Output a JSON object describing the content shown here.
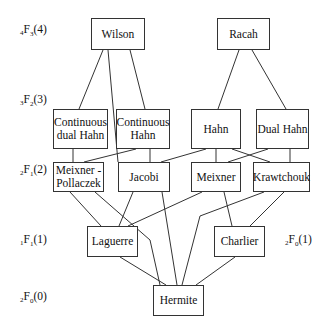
{
  "diagram": {
    "levels": [
      {
        "id": "l4",
        "pre": "4",
        "F": "F",
        "sub": "3",
        "arg": "(4)",
        "x": 20,
        "y": 31
      },
      {
        "id": "l3",
        "pre": "3",
        "F": "F",
        "sub": "2",
        "arg": "(3)",
        "x": 20,
        "y": 101
      },
      {
        "id": "l2",
        "pre": "2",
        "F": "F",
        "sub": "1",
        "arg": "(2)",
        "x": 20,
        "y": 171
      },
      {
        "id": "l1",
        "pre": "1",
        "F": "F",
        "sub": "1",
        "arg": "(1)",
        "x": 20,
        "y": 241
      },
      {
        "id": "l1b",
        "pre": "2",
        "F": "F",
        "sub": "0",
        "arg": "(1)",
        "x": 285,
        "y": 241
      },
      {
        "id": "l0",
        "pre": "2",
        "F": "F",
        "sub": "0",
        "arg": "(0)",
        "x": 20,
        "y": 298
      }
    ],
    "nodes": [
      {
        "id": "wilson",
        "label": "Wilson",
        "x": 91,
        "y": 18,
        "w": 54,
        "h": 32
      },
      {
        "id": "racah",
        "label": "Racah",
        "x": 217,
        "y": 18,
        "w": 53,
        "h": 32
      },
      {
        "id": "cdhahn",
        "label": "Continuous dual Hahn",
        "x": 53,
        "y": 109,
        "w": 55,
        "h": 40
      },
      {
        "id": "chahn",
        "label": "Continuous Hahn",
        "x": 116,
        "y": 109,
        "w": 54,
        "h": 40
      },
      {
        "id": "hahn",
        "label": "Hahn",
        "x": 191,
        "y": 109,
        "w": 50,
        "h": 40
      },
      {
        "id": "dhahn",
        "label": "Dual Hahn",
        "x": 256,
        "y": 109,
        "w": 53,
        "h": 40
      },
      {
        "id": "mp",
        "label": "Meixner - Pollaczek",
        "x": 53,
        "y": 162,
        "w": 51,
        "h": 30
      },
      {
        "id": "jacobi",
        "label": "Jacobi",
        "x": 118,
        "y": 162,
        "w": 52,
        "h": 30
      },
      {
        "id": "meixner",
        "label": "Meixner",
        "x": 191,
        "y": 162,
        "w": 50,
        "h": 30
      },
      {
        "id": "kraw",
        "label": "Krawtchouk",
        "x": 253,
        "y": 162,
        "w": 57,
        "h": 30
      },
      {
        "id": "laguerre",
        "label": "Laguerre",
        "x": 87,
        "y": 226,
        "w": 51,
        "h": 31
      },
      {
        "id": "charlier",
        "label": "Charlier",
        "x": 214,
        "y": 226,
        "w": 51,
        "h": 31
      },
      {
        "id": "hermite",
        "label": "Hermite",
        "x": 153,
        "y": 285,
        "w": 51,
        "h": 31
      }
    ],
    "edges": [
      {
        "from": "wilson",
        "to": "cdhahn",
        "pts": [
          [
            103,
            50
          ],
          [
            79,
            109
          ]
        ]
      },
      {
        "from": "wilson",
        "to": "chahn",
        "pts": [
          [
            130,
            50
          ],
          [
            145,
            109
          ]
        ]
      },
      {
        "from": "wilson",
        "to": "jacobi",
        "pts": [
          [
            108,
            50
          ],
          [
            118,
            162
          ]
        ]
      },
      {
        "from": "racah",
        "to": "hahn",
        "pts": [
          [
            239,
            50
          ],
          [
            218,
            109
          ]
        ]
      },
      {
        "from": "racah",
        "to": "dhahn",
        "pts": [
          [
            252,
            50
          ],
          [
            286,
            109
          ]
        ]
      },
      {
        "from": "cdhahn",
        "to": "mp",
        "pts": [
          [
            73,
            149
          ],
          [
            73,
            162
          ]
        ]
      },
      {
        "from": "chahn",
        "to": "mp",
        "pts": [
          [
            136,
            149
          ],
          [
            84,
            162
          ]
        ]
      },
      {
        "from": "chahn",
        "to": "jacobi",
        "pts": [
          [
            150,
            149
          ],
          [
            150,
            162
          ]
        ]
      },
      {
        "from": "hahn",
        "to": "jacobi",
        "pts": [
          [
            206,
            149
          ],
          [
            161,
            162
          ]
        ]
      },
      {
        "from": "hahn",
        "to": "meixner",
        "pts": [
          [
            216,
            149
          ],
          [
            216,
            162
          ]
        ]
      },
      {
        "from": "hahn",
        "to": "kraw",
        "pts": [
          [
            232,
            149
          ],
          [
            270,
            162
          ]
        ]
      },
      {
        "from": "dhahn",
        "to": "meixner",
        "pts": [
          [
            268,
            149
          ],
          [
            228,
            162
          ]
        ]
      },
      {
        "from": "dhahn",
        "to": "kraw",
        "pts": [
          [
            290,
            149
          ],
          [
            290,
            162
          ]
        ]
      },
      {
        "from": "mp",
        "to": "laguerre",
        "pts": [
          [
            70,
            192
          ],
          [
            101,
            226
          ]
        ]
      },
      {
        "from": "mp",
        "to": "hermite",
        "pts": [
          [
            95,
            192
          ],
          [
            150,
            240
          ],
          [
            160,
            285
          ]
        ]
      },
      {
        "from": "jacobi",
        "to": "laguerre",
        "pts": [
          [
            133,
            192
          ],
          [
            119,
            226
          ]
        ]
      },
      {
        "from": "jacobi",
        "to": "hermite",
        "pts": [
          [
            162,
            192
          ],
          [
            177,
            285
          ]
        ]
      },
      {
        "from": "meixner",
        "to": "laguerre",
        "pts": [
          [
            202,
            192
          ],
          [
            128,
            226
          ]
        ]
      },
      {
        "from": "meixner",
        "to": "charlier",
        "pts": [
          [
            224,
            192
          ],
          [
            232,
            226
          ]
        ]
      },
      {
        "from": "kraw",
        "to": "hermite",
        "pts": [
          [
            264,
            192
          ],
          [
            200,
            216
          ],
          [
            182,
            285
          ]
        ]
      },
      {
        "from": "kraw",
        "to": "charlier",
        "pts": [
          [
            284,
            192
          ],
          [
            250,
            226
          ]
        ]
      },
      {
        "from": "laguerre",
        "to": "hermite",
        "pts": [
          [
            120,
            257
          ],
          [
            166,
            285
          ]
        ]
      },
      {
        "from": "charlier",
        "to": "hermite",
        "pts": [
          [
            235,
            257
          ],
          [
            196,
            285
          ]
        ]
      }
    ]
  }
}
